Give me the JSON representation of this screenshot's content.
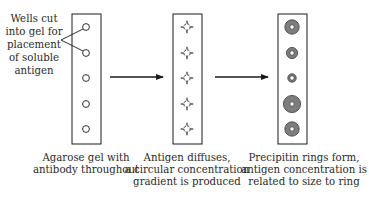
{
  "figure": {
    "callout": {
      "lines": [
        "Wells cut",
        "into gel for",
        "placement",
        "of soluble",
        "antigen"
      ]
    },
    "panels": [
      {
        "id": "gel",
        "caption": [
          "Agarose gel with",
          "antibody throughout"
        ],
        "well_count": 5
      },
      {
        "id": "diffusion",
        "caption": [
          "Antigen diffuses,",
          "a circular concentration",
          "gradient is produced"
        ],
        "well_count": 5
      },
      {
        "id": "rings",
        "caption": [
          "Precipitin rings form,",
          "antigen concentration is",
          "related to size to ring"
        ],
        "well_count": 5,
        "relative_ring_sizes": [
          "large",
          "medium",
          "small",
          "largest",
          "large"
        ]
      }
    ],
    "arrows": [
      {
        "from": "gel",
        "to": "diffusion"
      },
      {
        "from": "diffusion",
        "to": "rings"
      }
    ],
    "colors": {
      "line": "#1a1a1a",
      "ring_fill": "#7d7d7d",
      "text": "#2a2a2a"
    }
  }
}
